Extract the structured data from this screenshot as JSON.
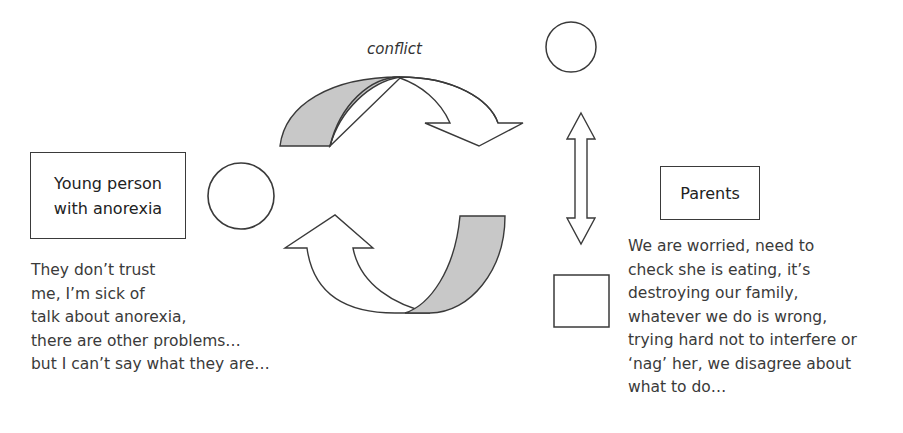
{
  "diagram": {
    "label_conflict": "conflict",
    "young_person": {
      "title": "Young person\nwith anorexia",
      "quote": "They don’t trust\nme, I’m sick of\ntalk about anorexia,\nthere are other problems…\nbut I can’t say what they are…"
    },
    "parents": {
      "title": "Parents",
      "quote": "We are worried, need to\ncheck she is eating, it’s\ndestroying our family,\nwhatever we do is wrong,\ntrying hard not to interfere or\n‘nag’ her, we disagree about\nwhat to do…"
    },
    "colors": {
      "stroke": "#3a3a3a",
      "gray_fill": "#c8c8c8",
      "background": "#ffffff"
    },
    "shapes": {
      "young_person_symbol": "circle",
      "parent_symbols": [
        "circle",
        "square"
      ],
      "cycle_arrows": [
        "curved-arrow-right-down",
        "curved-arrow-left-up"
      ],
      "parent_link": "double-headed-vertical-arrow"
    }
  }
}
